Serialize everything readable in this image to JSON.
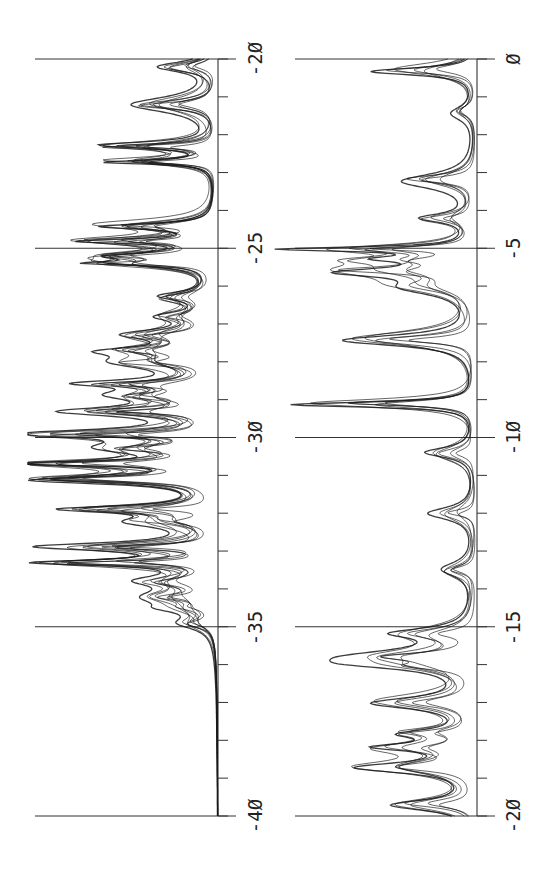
{
  "chart_data": [
    {
      "type": "line",
      "title": "",
      "xlabel": "",
      "ylabel": "",
      "orientation": "rotated-90 (energy axis vertical, intensity grows to the left)",
      "axis_range": [
        -40,
        -20
      ],
      "major_ticks": [
        -20,
        -25,
        -30,
        -35,
        -40
      ],
      "tick_labels": [
        "-20",
        "-25",
        "-30",
        "-35",
        "-40"
      ],
      "minor_tick_step": 1,
      "grid": "major lines only",
      "legend": null,
      "series_description": "many overlapping spectral curves (approx. 8-10 traces), sharp Lorentzian-like peaks",
      "peaks": [
        {
          "x": -20.2,
          "height": 0.29
        },
        {
          "x": -21.2,
          "height": 0.44
        },
        {
          "x": -22.3,
          "height": 0.59
        },
        {
          "x": -22.7,
          "height": 0.56
        },
        {
          "x": -24.4,
          "height": 0.58
        },
        {
          "x": -24.8,
          "height": 0.66
        },
        {
          "x": -25.2,
          "height": 0.51
        },
        {
          "x": -25.4,
          "height": 0.53
        },
        {
          "x": -26.3,
          "height": 0.26
        },
        {
          "x": -26.8,
          "height": 0.24
        },
        {
          "x": -27.3,
          "height": 0.4
        },
        {
          "x": -27.7,
          "height": 0.4
        },
        {
          "x": -28.0,
          "height": 0.43
        },
        {
          "x": -28.6,
          "height": 0.55
        },
        {
          "x": -28.9,
          "height": 0.41
        },
        {
          "x": -29.3,
          "height": 0.69
        },
        {
          "x": -29.9,
          "height": 0.88
        },
        {
          "x": -30.3,
          "height": 0.5
        },
        {
          "x": -30.7,
          "height": 0.96
        },
        {
          "x": -31.1,
          "height": 0.9
        },
        {
          "x": -31.9,
          "height": 0.71
        },
        {
          "x": -32.2,
          "height": 0.37
        },
        {
          "x": -32.9,
          "height": 0.87
        },
        {
          "x": -33.3,
          "height": 0.84
        },
        {
          "x": -33.8,
          "height": 0.31
        },
        {
          "x": -34.2,
          "height": 0.31
        },
        {
          "x": -34.5,
          "height": 0.15
        },
        {
          "x": -34.9,
          "height": 0.15
        }
      ]
    },
    {
      "type": "line",
      "title": "",
      "xlabel": "",
      "ylabel": "",
      "orientation": "rotated-90 (energy axis vertical, intensity grows to the left)",
      "axis_range": [
        -20,
        0
      ],
      "major_ticks": [
        0,
        -5,
        -10,
        -15,
        -20
      ],
      "tick_labels": [
        "0",
        "-5",
        "-10",
        "-15",
        "-20"
      ],
      "minor_tick_step": 1,
      "grid": "major lines only",
      "legend": null,
      "series_description": "several overlapping spectral curves (approx. 5-6 traces), isolated sharp peaks with broad shoulders",
      "peaks": [
        {
          "x": -0.3,
          "height": 0.36
        },
        {
          "x": -1.4,
          "height": 0.08
        },
        {
          "x": -3.2,
          "height": 0.25
        },
        {
          "x": -4.2,
          "height": 0.17
        },
        {
          "x": -5.0,
          "height": 0.62
        },
        {
          "x": -5.3,
          "height": 0.25
        },
        {
          "x": -5.6,
          "height": 0.41
        },
        {
          "x": -6.0,
          "height": 0.21
        },
        {
          "x": -7.4,
          "height": 0.45
        },
        {
          "x": -9.1,
          "height": 0.63
        },
        {
          "x": -10.4,
          "height": 0.17
        },
        {
          "x": -12.0,
          "height": 0.16
        },
        {
          "x": -13.5,
          "height": 0.11
        },
        {
          "x": -15.2,
          "height": 0.24
        },
        {
          "x": -15.8,
          "height": 0.37
        },
        {
          "x": -16.0,
          "height": 0.21
        },
        {
          "x": -17.0,
          "height": 0.33
        },
        {
          "x": -17.8,
          "height": 0.21
        },
        {
          "x": -18.2,
          "height": 0.29
        },
        {
          "x": -18.7,
          "height": 0.39
        },
        {
          "x": -19.7,
          "height": 0.28
        }
      ]
    }
  ],
  "panels": {
    "left": {
      "labels": [
        "-20",
        "-25",
        "-30",
        "-35",
        "-40"
      ]
    },
    "right": {
      "labels": [
        "0",
        "-5",
        "-10",
        "-15",
        "-20"
      ]
    }
  },
  "colors": {
    "line": "#1a1a1a",
    "axis": "#333333",
    "background": "#ffffff"
  }
}
